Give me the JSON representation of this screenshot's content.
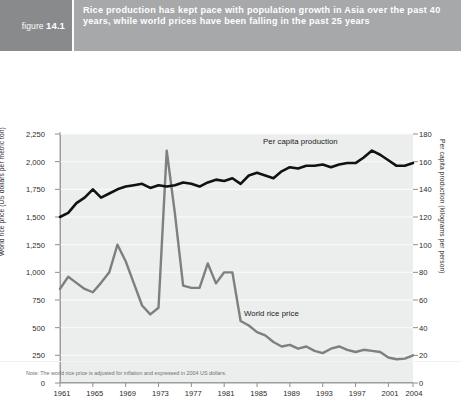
{
  "figure": {
    "prefix": "figure",
    "number": "14.1"
  },
  "header": {
    "title": "Rice production has kept pace with population growth in Asia over the past 40 years, while world prices have been falling in the past 25 years"
  },
  "note": "Note: The world rice price is adjusted for inflation and expressed in 2004 US dollars.",
  "colors": {
    "figure_block": "#888a8c",
    "title_block": "#a6a8aa",
    "plot_background": "#eceded",
    "gridline": "#fdfdfd",
    "production_series": "#111111",
    "price_series": "#7d7f81"
  },
  "chart_data": {
    "type": "line",
    "title": "Rice production has kept pace with population growth in Asia over the past 40 years, while world prices have been falling in the past 25 years",
    "xlabel": "",
    "ylabel": "World rice price (US dollars per metric ton)",
    "y2label": "Per capita production (kilograms per person)",
    "grid": true,
    "legend_position": "inline-annotation",
    "xlim": [
      1961,
      2004
    ],
    "ylim": [
      0,
      2250
    ],
    "y2lim": [
      0,
      180
    ],
    "yticks": [
      "0",
      "250",
      "500",
      "750",
      "1,000",
      "1,250",
      "1,500",
      "1,750",
      "2,000",
      "2,250"
    ],
    "y2ticks": [
      "0",
      "20",
      "40",
      "60",
      "80",
      "100",
      "120",
      "140",
      "160",
      "180"
    ],
    "xticks": [
      "1961",
      "1965",
      "1969",
      "1973",
      "1977",
      "1981",
      "1985",
      "1989",
      "1993",
      "1997",
      "2001",
      "2004"
    ],
    "x": [
      1961,
      1962,
      1963,
      1964,
      1965,
      1966,
      1967,
      1968,
      1969,
      1970,
      1971,
      1972,
      1973,
      1974,
      1975,
      1976,
      1977,
      1978,
      1979,
      1980,
      1981,
      1982,
      1983,
      1984,
      1985,
      1986,
      1987,
      1988,
      1989,
      1990,
      1991,
      1992,
      1993,
      1994,
      1995,
      1996,
      1997,
      1998,
      1999,
      2000,
      2001,
      2002,
      2003,
      2004
    ],
    "series": [
      {
        "name": "Per capita production",
        "axis": "right",
        "unit": "kilograms per person",
        "values": [
          120,
          123,
          130,
          134,
          140,
          134,
          137,
          140,
          142,
          143,
          144,
          141,
          143,
          142,
          143,
          145,
          144,
          142,
          145,
          147,
          146,
          148,
          144,
          150,
          152,
          150,
          148,
          153,
          156,
          155,
          157,
          157,
          158,
          156,
          158,
          159,
          159,
          163,
          168,
          165,
          161,
          157,
          157,
          159
        ]
      },
      {
        "name": "World rice price",
        "axis": "left",
        "unit": "US dollars per metric ton",
        "values": [
          850,
          960,
          905,
          850,
          820,
          905,
          1000,
          1250,
          1100,
          900,
          700,
          620,
          680,
          2100,
          1530,
          880,
          860,
          860,
          1080,
          900,
          1000,
          1000,
          560,
          520,
          460,
          430,
          370,
          330,
          345,
          310,
          330,
          290,
          270,
          310,
          330,
          300,
          280,
          300,
          290,
          280,
          230,
          215,
          220,
          250
        ]
      }
    ],
    "annotations": [
      {
        "text": "Per capita production",
        "series": "Per capita production"
      },
      {
        "text": "World rice price",
        "series": "World rice price"
      }
    ]
  }
}
